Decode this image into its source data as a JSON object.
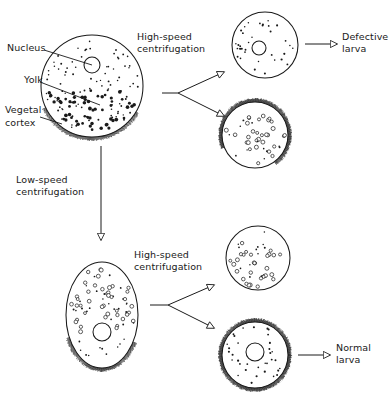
{
  "figure": {
    "background_color": "#ffffff",
    "ink_color": "#1a1a1a"
  },
  "labels": {
    "nucleus": "Nucleus",
    "yolk": "Yolk",
    "vegetal_cortex_line1": "Vegetal",
    "vegetal_cortex_line2": "cortex",
    "high_speed_top_line1": "High-speed",
    "high_speed_top_line2": "centrifugation",
    "low_speed_line1": "Low-speed",
    "low_speed_line2": "centrifugation",
    "high_speed_bottom_line1": "High-speed",
    "high_speed_bottom_line2": "centrifugation",
    "defective_larva_line1": "Defective",
    "defective_larva_line2": "larva",
    "normal_larva_line1": "Normal",
    "normal_larva_line2": "larva"
  },
  "cells": [
    {
      "id": "original-egg",
      "name": "original-egg",
      "shape": "circle",
      "center": [
        92,
        86
      ],
      "radius": 51,
      "nucleus": {
        "center": [
          92,
          65
        ],
        "radius": 8
      },
      "cortex": {
        "present": true,
        "arc": "bottom"
      },
      "yolk_style": "filled-dark",
      "description": "Untreated egg: nucleus near animal pole, yolk granules in vegetal half, bristled vegetal cortex along bottom"
    },
    {
      "id": "high-speed-upper-fragment",
      "name": "defective-egg-fragment",
      "shape": "circle",
      "center": [
        265,
        45
      ],
      "radius": 33,
      "nucleus": {
        "center": [
          259,
          48
        ],
        "radius": 7
      },
      "cortex": {
        "present": false,
        "arc": "none"
      },
      "yolk_style": "fine-dots",
      "description": "Nucleated fragment lacking vegetal cortex"
    },
    {
      "id": "high-speed-lower-fragment",
      "name": "cortex-yolk-fragment",
      "shape": "circle",
      "center": [
        255,
        135
      ],
      "radius": 33,
      "nucleus": null,
      "cortex": {
        "present": true,
        "arc": "most"
      },
      "yolk_style": "open-circles",
      "description": "Anucleate fragment containing yolk and vegetal cortex"
    },
    {
      "id": "low-speed-egg",
      "name": "stratified-egg",
      "shape": "ellipse",
      "center": [
        102,
        315
      ],
      "radius": [
        36,
        53
      ],
      "nucleus": {
        "center": [
          102,
          332
        ],
        "radius": 9
      },
      "cortex": {
        "present": true,
        "arc": "bottom"
      },
      "yolk_style": "open-circles",
      "description": "Low-speed stratified egg: yolk displaced to upper half, nucleus moved toward vegetal pole, cortex intact at bottom"
    },
    {
      "id": "low-then-high-upper-fragment",
      "name": "yolk-fragment",
      "shape": "circle",
      "center": [
        258,
        258
      ],
      "radius": 32,
      "nucleus": null,
      "cortex": {
        "present": false,
        "arc": "none"
      },
      "yolk_style": "open-circles",
      "description": "Anucleate yolk-rich fragment without cortex"
    },
    {
      "id": "low-then-high-lower-fragment",
      "name": "normal-egg-fragment",
      "shape": "circle",
      "center": [
        255,
        355
      ],
      "radius": 33,
      "nucleus": {
        "center": [
          255,
          352
        ],
        "radius": 9
      },
      "cortex": {
        "present": true,
        "arc": "full"
      },
      "yolk_style": "fine-dots",
      "description": "Nucleated fragment retaining full vegetal cortex"
    }
  ],
  "arrows": [
    {
      "name": "low-speed-arrow",
      "from": [
        101,
        146
      ],
      "to": [
        101,
        240
      ],
      "kind": "straight-down",
      "head": "open-triangle"
    },
    {
      "name": "high-speed-top-branch-stub",
      "from": [
        162,
        93
      ],
      "to": [
        178,
        93
      ],
      "kind": "stub",
      "head": "none"
    },
    {
      "name": "high-speed-top-branch-upper",
      "from": [
        178,
        93
      ],
      "to": [
        224,
        72
      ],
      "kind": "branch-up",
      "head": "open-triangle"
    },
    {
      "name": "high-speed-top-branch-lower",
      "from": [
        178,
        93
      ],
      "to": [
        224,
        116
      ],
      "kind": "branch-down",
      "head": "open-triangle"
    },
    {
      "name": "defective-larva-arrow",
      "from": [
        305,
        44
      ],
      "to": [
        337,
        44
      ],
      "kind": "straight-right",
      "head": "open-triangle"
    },
    {
      "name": "high-speed-bottom-branch-stub",
      "from": [
        150,
        305
      ],
      "to": [
        168,
        305
      ],
      "kind": "stub",
      "head": "none"
    },
    {
      "name": "high-speed-bottom-branch-upper",
      "from": [
        168,
        305
      ],
      "to": [
        214,
        285
      ],
      "kind": "branch-up",
      "head": "open-triangle"
    },
    {
      "name": "high-speed-bottom-branch-lower",
      "from": [
        168,
        305
      ],
      "to": [
        214,
        328
      ],
      "kind": "branch-down",
      "head": "open-triangle"
    },
    {
      "name": "normal-larva-arrow",
      "from": [
        298,
        355
      ],
      "to": [
        330,
        355
      ],
      "kind": "straight-right",
      "head": "open-triangle"
    }
  ],
  "leader_lines": [
    {
      "name": "nucleus-leader",
      "from": [
        44,
        50
      ],
      "to": [
        92,
        65
      ]
    },
    {
      "name": "yolk-leader",
      "from": [
        40,
        82
      ],
      "to": [
        100,
        105
      ]
    },
    {
      "name": "vegetal-cortex-leader",
      "from": [
        40,
        117
      ],
      "to": [
        62,
        124
      ]
    }
  ]
}
